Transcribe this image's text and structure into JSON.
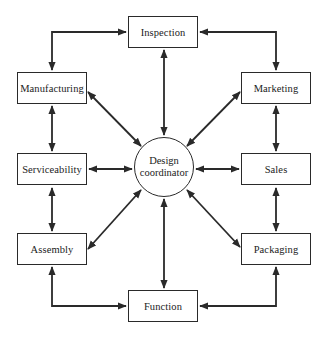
{
  "diagram": {
    "center": {
      "line1": "Design",
      "line2": "coordinator"
    },
    "nodes": {
      "inspection": "Inspection",
      "manufacturing": "Manufacturing",
      "marketing": "Marketing",
      "serviceability": "Serviceability",
      "sales": "Sales",
      "assembly": "Assembly",
      "packaging": "Packaging",
      "function": "Function"
    },
    "colors": {
      "stroke": "#2a2a2a",
      "background": "#ffffff"
    }
  }
}
